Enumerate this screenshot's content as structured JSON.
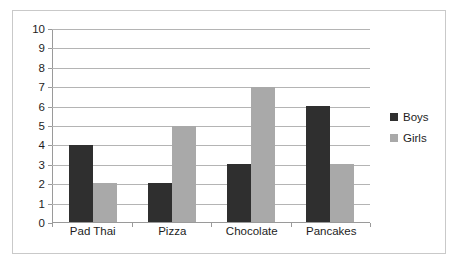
{
  "chart_data": {
    "type": "bar",
    "title": "",
    "subtitle": "",
    "xlabel": "",
    "ylabel": "",
    "categories": [
      "Pad Thai",
      "Pizza",
      "Chocolate",
      "Pancakes"
    ],
    "series": [
      {
        "name": "Boys",
        "color": "#2f2f2f",
        "values": [
          4,
          2,
          3,
          6
        ]
      },
      {
        "name": "Girls",
        "color": "#a9a9a9",
        "values": [
          2,
          5,
          7,
          3
        ]
      }
    ],
    "ylim": [
      0,
      10
    ],
    "ytick_labels": [
      "10",
      "9",
      "8",
      "7",
      "6",
      "5",
      "4",
      "3",
      "2",
      "1",
      "0"
    ],
    "ytick_values": [
      10,
      9,
      8,
      7,
      6,
      5,
      4,
      3,
      2,
      1,
      0
    ],
    "ytick_step": 1,
    "grid": true,
    "grid_orientation": "horizontal",
    "legend_position": "right",
    "legend_entries": [
      {
        "label": "Boys",
        "color": "#2f2f2f"
      },
      {
        "label": "Girls",
        "color": "#a9a9a9"
      }
    ],
    "frame_border_color": "#c9c9c9",
    "axis_line_color": "#9a9a9a",
    "gridline_color": "#b4b4b4",
    "plot_background": "#ffffff"
  }
}
